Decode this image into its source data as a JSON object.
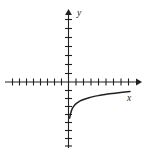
{
  "figure": {
    "title": "",
    "background_color": "#ffffff",
    "ink_color": "#231f20",
    "x_axis_label": "x",
    "y_axis_label": "y"
  },
  "chart_data": {
    "type": "line",
    "title": "",
    "xlabel": "x",
    "ylabel": "y",
    "grid": false,
    "legend": null,
    "axis_style": "arrows-both-ends-with-unit-ticks",
    "xlim": [
      -8,
      9
    ],
    "ylim": [
      -8,
      8
    ],
    "x_ticks": [
      -8,
      -7,
      -6,
      -5,
      -4,
      -3,
      -2,
      -1,
      1,
      2,
      3,
      4,
      5,
      6,
      7,
      8
    ],
    "y_ticks": [
      -8,
      -7,
      -6,
      -5,
      -4,
      -3,
      -2,
      -1,
      1,
      2,
      3,
      4,
      5,
      6,
      7
    ],
    "tick_labels_shown": false,
    "series": [
      {
        "name": "logarithmic curve",
        "description": "increasing concave-down curve in fourth-to-first quadrant region, vertical asymptote at x = 0, rising from about y = -4 near the y-axis toward y = -1 at the right edge",
        "x": [
          0.15,
          0.3,
          0.5,
          0.8,
          1.2,
          1.8,
          2.5,
          3.3,
          4.2,
          5.2,
          6.2,
          7.2,
          8.2
        ],
        "y": [
          -4.2,
          -3.6,
          -3.1,
          -2.7,
          -2.4,
          -2.1,
          -1.9,
          -1.7,
          -1.55,
          -1.4,
          -1.3,
          -1.2,
          -1.1
        ]
      }
    ]
  }
}
